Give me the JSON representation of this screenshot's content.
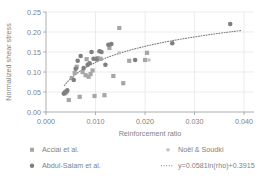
{
  "chart_data": {
    "type": "scatter",
    "title": "",
    "xlabel": "Reinforcement ratio",
    "ylabel": "Normalized shear stress",
    "xlim": [
      0.0,
      0.042
    ],
    "ylim": [
      0.0,
      0.25
    ],
    "xticks": [
      0.0,
      0.01,
      0.02,
      0.03,
      0.04
    ],
    "xtick_labels": [
      "0.000",
      "0.010",
      "0.020",
      "0.030",
      "0.040"
    ],
    "yticks": [
      0.0,
      0.05,
      0.1,
      0.15,
      0.2,
      0.25
    ],
    "ytick_labels": [
      "0.00",
      "0.05",
      "0.10",
      "0.15",
      "0.20",
      "0.25"
    ],
    "grid": true,
    "legend_position": "bottom",
    "series": [
      {
        "name": "Acciai et al.",
        "marker": "square",
        "color": "#a6a6a6",
        "points": [
          [
            0.0038,
            0.047
          ],
          [
            0.004,
            0.049
          ],
          [
            0.0042,
            0.052
          ],
          [
            0.0046,
            0.03
          ],
          [
            0.0052,
            0.085
          ],
          [
            0.0058,
            0.098
          ],
          [
            0.0062,
            0.113
          ],
          [
            0.0068,
            0.038
          ],
          [
            0.0074,
            0.1
          ],
          [
            0.008,
            0.092
          ],
          [
            0.0082,
            0.132
          ],
          [
            0.0086,
            0.088
          ],
          [
            0.009,
            0.095
          ],
          [
            0.0094,
            0.104
          ],
          [
            0.0098,
            0.04
          ],
          [
            0.0104,
            0.135
          ],
          [
            0.011,
            0.133
          ],
          [
            0.0118,
            0.042
          ],
          [
            0.0128,
            0.16
          ],
          [
            0.0136,
            0.09
          ],
          [
            0.0148,
            0.21
          ],
          [
            0.0156,
            0.072
          ],
          [
            0.0168,
            0.128
          ],
          [
            0.02,
            0.13
          ],
          [
            0.0204,
            0.148
          ]
        ]
      },
      {
        "name": "Abdul-Salam et al.",
        "marker": "circle",
        "color": "#7f7f7f",
        "points": [
          [
            0.0036,
            0.046
          ],
          [
            0.0039,
            0.05
          ],
          [
            0.0043,
            0.054
          ],
          [
            0.0056,
            0.08
          ],
          [
            0.006,
            0.108
          ],
          [
            0.0064,
            0.128
          ],
          [
            0.007,
            0.14
          ],
          [
            0.0076,
            0.11
          ],
          [
            0.0084,
            0.118
          ],
          [
            0.0088,
            0.122
          ],
          [
            0.0092,
            0.15
          ],
          [
            0.0096,
            0.133
          ],
          [
            0.0102,
            0.132
          ],
          [
            0.0108,
            0.152
          ],
          [
            0.0112,
            0.15
          ],
          [
            0.012,
            0.118
          ],
          [
            0.0126,
            0.168
          ],
          [
            0.0132,
            0.17
          ],
          [
            0.018,
            0.13
          ],
          [
            0.0255,
            0.172
          ],
          [
            0.0372,
            0.22
          ]
        ]
      },
      {
        "name": "Noël & Soudki",
        "marker": "square-small",
        "color": "#bfbfbf",
        "points": [
          [
            0.0148,
            0.148
          ],
          [
            0.0208,
            0.13
          ]
        ]
      }
    ],
    "trendline": {
      "label": "y=0.0581ln(rho)+0.3915",
      "style": "dotted",
      "color": "#808080",
      "coef_a": 0.0581,
      "coef_b": 0.3915,
      "x_start": 0.0037,
      "x_end": 0.0395
    }
  },
  "legend": {
    "items": [
      {
        "label": "Acciai et al.",
        "marker": "square-marker"
      },
      {
        "label": "Noël & Soudki",
        "marker": "square-small-marker"
      },
      {
        "label": "Abdul-Salam et al.",
        "marker": "circle-marker"
      },
      {
        "label": "y=0.0581ln(rho)+0.3915",
        "marker": "dotted-line-marker"
      }
    ]
  }
}
